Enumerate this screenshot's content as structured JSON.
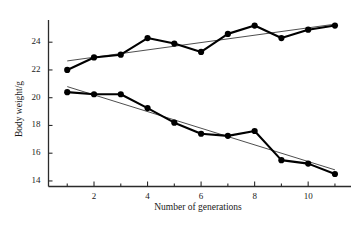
{
  "chart_data": {
    "type": "line",
    "title": "",
    "xlabel": "Number of generations",
    "ylabel": "Body weight/g",
    "x": [
      1,
      2,
      3,
      4,
      5,
      6,
      7,
      8,
      9,
      10,
      11
    ],
    "xlim": [
      0.3,
      11.6
    ],
    "ylim": [
      13.6,
      25.6
    ],
    "xticks": [
      2,
      4,
      6,
      8,
      10
    ],
    "xtick_labels": [
      "2",
      "4",
      "6",
      "8",
      "10"
    ],
    "yticks": [
      14,
      16,
      18,
      20,
      22,
      24
    ],
    "ytick_labels": [
      "14",
      "16",
      "18",
      "20",
      "22",
      "24"
    ],
    "grid": false,
    "legend": "none",
    "marker": "filled-circle",
    "series": [
      {
        "name": "upward-selected line",
        "values": [
          22.0,
          22.9,
          23.1,
          24.3,
          23.9,
          23.3,
          24.6,
          25.2,
          24.3,
          24.9,
          25.2
        ],
        "color": "#000000"
      },
      {
        "name": "downward-selected line",
        "values": [
          20.4,
          20.25,
          20.25,
          19.25,
          18.2,
          17.4,
          17.25,
          17.6,
          15.5,
          15.25,
          14.5
        ],
        "color": "#000000"
      }
    ],
    "trendlines": [
      {
        "name": "upper-regression-line",
        "x": [
          1,
          11
        ],
        "y": [
          22.65,
          25.3
        ],
        "color": "#3a3a3a"
      },
      {
        "name": "lower-regression-line",
        "x": [
          1,
          11
        ],
        "y": [
          20.8,
          14.8
        ],
        "color": "#3a3a3a"
      }
    ],
    "annotations": []
  },
  "axes": {
    "y_axis_name": "body-weight-axis",
    "x_axis_name": "generations-axis"
  }
}
